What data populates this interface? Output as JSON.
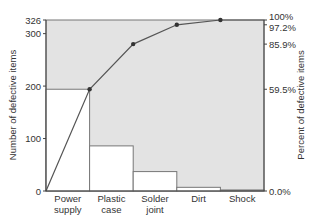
{
  "chart_data": {
    "type": "bar",
    "subtype": "pareto",
    "title": "",
    "categories": [
      "Power supply",
      "Plastic case",
      "Solder joint",
      "Dirt",
      "Shock"
    ],
    "category_lines": [
      [
        "Power",
        "supply"
      ],
      [
        "Plastic",
        "case"
      ],
      [
        "Solder",
        "joint"
      ],
      [
        "Dirt"
      ],
      [
        "Shock"
      ]
    ],
    "series": [
      {
        "name": "Number of defective items",
        "type": "bar",
        "axis": "left",
        "values": [
          194,
          86,
          37,
          7,
          2
        ]
      },
      {
        "name": "Cumulative percent of defective items",
        "type": "line",
        "axis": "right",
        "values": [
          59.5,
          85.9,
          97.2,
          100.0,
          100.0
        ]
      }
    ],
    "ylabel": "Number of defective items",
    "ylabel_right": "Percent of defective items",
    "ylim": [
      0,
      326
    ],
    "ylim_right": [
      0,
      100
    ],
    "yticks_left": [
      0,
      100,
      200,
      300,
      326
    ],
    "yticks_right": [
      "0.0%",
      "59.5%",
      "85.9%",
      "97.2%",
      "100%"
    ],
    "yticks_right_values": [
      0,
      59.5,
      85.9,
      97.2,
      100
    ],
    "grid": false,
    "legend": "none",
    "colors": {
      "background_fill": "#e3e3e3",
      "bars": "#ffffff",
      "line": "#555555",
      "axis": "#444444"
    }
  }
}
